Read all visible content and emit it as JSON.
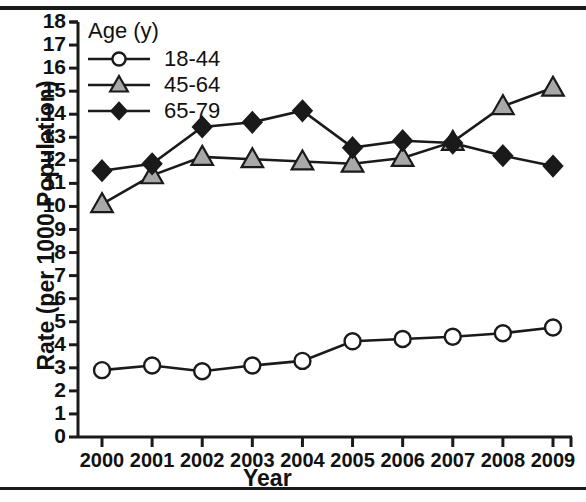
{
  "figure": {
    "width": 586,
    "height": 502
  },
  "chart_data": {
    "type": "line",
    "title": "",
    "xlabel": "Year",
    "ylabel": "Rate (per 1000 Population)",
    "legend_title": "Age (y)",
    "legend_position": "top-left-inside",
    "grid": false,
    "categories": [
      "2000",
      "2001",
      "2002",
      "2003",
      "2004",
      "2005",
      "2006",
      "2007",
      "2008",
      "2009"
    ],
    "x": [
      2000,
      2001,
      2002,
      2003,
      2004,
      2005,
      2006,
      2007,
      2008,
      2009
    ],
    "xlim": [
      2000,
      2009
    ],
    "ylim": [
      0,
      18
    ],
    "yticks": [
      0,
      1,
      2,
      3,
      4,
      5,
      6,
      7,
      8,
      9,
      10,
      11,
      12,
      13,
      14,
      15,
      16,
      17,
      18
    ],
    "series": [
      {
        "name": "18-44",
        "marker": "circle-open",
        "color": "#ffffff",
        "edge_color": "#1a1a1a",
        "values": [
          2.9,
          3.1,
          2.85,
          3.1,
          3.3,
          4.15,
          4.25,
          4.35,
          4.5,
          4.75
        ]
      },
      {
        "name": "45-64",
        "marker": "triangle-gray",
        "color": "#a8a8a8",
        "edge_color": "#1a1a1a",
        "values": [
          10.1,
          11.35,
          12.15,
          12.05,
          11.95,
          11.85,
          12.1,
          12.8,
          14.35,
          15.15
        ]
      },
      {
        "name": "65-79",
        "marker": "diamond-black",
        "color": "#1a1a1a",
        "edge_color": "#1a1a1a",
        "values": [
          11.55,
          11.85,
          13.45,
          13.65,
          14.15,
          12.55,
          12.85,
          12.75,
          12.2,
          11.75
        ]
      }
    ]
  }
}
